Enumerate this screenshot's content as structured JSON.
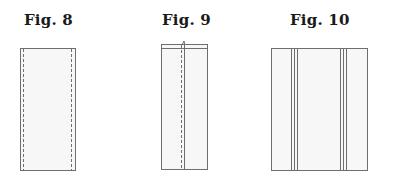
{
  "figures": [
    {
      "label": "Fig. 8",
      "description": "Rectangle with dashed stitch lines along both long edges",
      "label_x": 24
    },
    {
      "label": "Fig. 9",
      "description": "Narrow folded rectangle with top band and central seam with dashed stitching",
      "label_x": 162
    },
    {
      "label": "Fig. 10",
      "description": "Wide rectangle with two groups of three parallel vertical lines",
      "label_x": 290
    }
  ],
  "colors": {
    "stroke": "#6e6e6e",
    "fill": "#f7f7f7",
    "label": "#1a1a1a"
  }
}
